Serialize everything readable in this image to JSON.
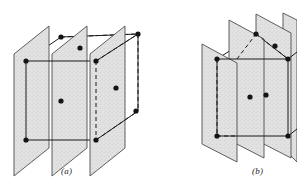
{
  "figure": {
    "background_color": "#ffffff",
    "line_color": "#1a1a1a",
    "plane_fill_color": "#e2e2e2",
    "plane_edge_color": "#4d4d4d",
    "atom_color": "#141414",
    "atom_radius": 2.6,
    "panels": [
      {
        "id": "a",
        "caption": "(a)",
        "description": "Three parallel vertical lattice planes cutting a body-centred cubic cell; planes are normal to the viewing-left face",
        "plane_count": 3,
        "cube": {
          "front_face": [
            [
              22,
              62
            ],
            [
              103,
              62
            ],
            [
              103,
              143
            ],
            [
              22,
              143
            ]
          ],
          "depth_vector": [
            35,
            -28
          ]
        },
        "planes": [
          {
            "name": "plane-1-left",
            "polygon": [
              [
                14,
                54
              ],
              [
                49,
                26
              ],
              [
                49,
                148
              ],
              [
                14,
                176
              ]
            ]
          },
          {
            "name": "plane-2-middle",
            "polygon": [
              [
                52,
                54
              ],
              [
                87,
                26
              ],
              [
                87,
                148
              ],
              [
                52,
                176
              ]
            ]
          },
          {
            "name": "plane-3-right",
            "polygon": [
              [
                90,
                54
              ],
              [
                125,
                26
              ],
              [
                125,
                148
              ],
              [
                90,
                176
              ]
            ]
          }
        ],
        "atoms": [
          {
            "name": "atom-top-back-left",
            "x": 61,
            "y": 37
          },
          {
            "name": "atom-top-back-mid",
            "x": 80,
            "y": 48
          },
          {
            "name": "atom-top-back-right",
            "x": 138,
            "y": 34
          },
          {
            "name": "atom-top-front-left",
            "x": 26,
            "y": 61
          },
          {
            "name": "atom-top-front-right",
            "x": 96,
            "y": 61
          },
          {
            "name": "atom-body-centre-left",
            "x": 61,
            "y": 101
          },
          {
            "name": "atom-body-centre-right",
            "x": 116,
            "y": 88
          },
          {
            "name": "atom-right-back-lower",
            "x": 136,
            "y": 111
          },
          {
            "name": "atom-bottom-front-left",
            "x": 26,
            "y": 140
          },
          {
            "name": "atom-bottom-front-right",
            "x": 96,
            "y": 140
          }
        ]
      },
      {
        "id": "b",
        "caption": "(b)",
        "description": "Parallel lattice planes inclined to the cube axes, cutting the body-centred cubic cell diagonally",
        "plane_count": 4,
        "cube": {
          "front_face": [
            [
              213,
              62
            ],
            [
              289,
              62
            ],
            [
              289,
              143
            ],
            [
              213,
              143
            ]
          ],
          "depth_vector": [
            33,
            -27
          ]
        },
        "planes": [
          {
            "name": "plane-1-left",
            "polygon": [
              [
                204,
                44
              ],
              [
                239,
                62
              ],
              [
                239,
                160
              ],
              [
                204,
                142
              ]
            ]
          },
          {
            "name": "plane-2",
            "polygon": [
              [
                231,
                20
              ],
              [
                266,
                38
              ],
              [
                266,
                160
              ],
              [
                231,
                142
              ]
            ]
          },
          {
            "name": "plane-3",
            "polygon": [
              [
                258,
                14
              ],
              [
                293,
                32
              ],
              [
                293,
                160
              ],
              [
                258,
                142
              ]
            ]
          },
          {
            "name": "plane-4-right",
            "polygon": [
              [
                285,
                14
              ],
              [
                297,
                20
              ],
              [
                297,
                160
              ],
              [
                285,
                142
              ]
            ]
          }
        ],
        "atoms": [
          {
            "name": "atom-top-back-left",
            "x": 217,
            "y": 59
          },
          {
            "name": "atom-top-back-mid",
            "x": 275,
            "y": 46
          },
          {
            "name": "atom-top-back-right",
            "x": 256,
            "y": 34
          },
          {
            "name": "atom-top-front-right",
            "x": 288,
            "y": 59
          },
          {
            "name": "atom-body-centre",
            "x": 250,
            "y": 97
          },
          {
            "name": "atom-bottom-front-left",
            "x": 217,
            "y": 136
          },
          {
            "name": "atom-bottom-front-right",
            "x": 288,
            "y": 136
          },
          {
            "name": "atom-right-mid",
            "x": 266,
            "y": 95
          }
        ]
      }
    ]
  }
}
